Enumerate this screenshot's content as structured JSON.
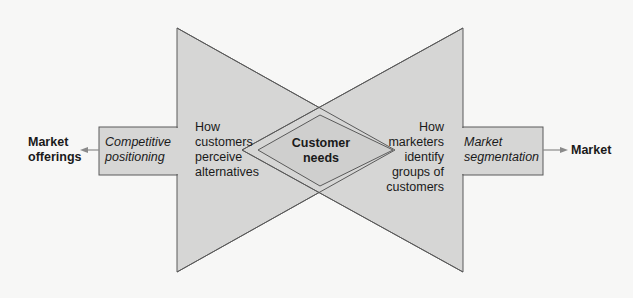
{
  "diagram": {
    "left_endpoint": {
      "line1": "Market",
      "line2": "offerings"
    },
    "right_endpoint": {
      "label": "Market"
    },
    "left_box": {
      "line1": "Competitive",
      "line2": "positioning"
    },
    "right_box": {
      "line1": "Market",
      "line2": "segmentation"
    },
    "left_triangle_text": {
      "line1": "How",
      "line2": "customers",
      "line3": "perceive",
      "line4": "alternatives"
    },
    "right_triangle_text": {
      "line1": "How",
      "line2": "marketers",
      "line3": "identify",
      "line4": "groups of",
      "line5": "customers"
    },
    "center_diamond": {
      "line1": "Customer",
      "line2": "needs"
    },
    "colors": {
      "background": "#f7f7f6",
      "shape_fill": "#d6d6d5",
      "stroke": "#5a5a5a",
      "arrow": "#8a8a8a",
      "text": "#1a1a1a"
    }
  }
}
